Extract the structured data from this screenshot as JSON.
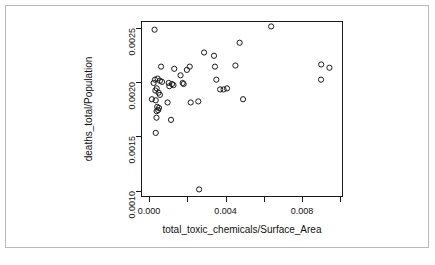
{
  "figure": {
    "background": "#ffffff",
    "frame_color": "#b9b9b9",
    "axis_color": "#1a1a1a",
    "point_color": "#1a1a1a"
  },
  "chart_data": {
    "type": "scatter",
    "title": "",
    "xlabel": "total_toxic_chemicals/Surface_Area",
    "ylabel": "deaths_total/Population",
    "xlim": [
      -0.00042,
      0.01015
    ],
    "ylim": [
      0.00094,
      0.00256
    ],
    "xticks": [
      0.0,
      0.004,
      0.008
    ],
    "xtick_labels": [
      "0.000",
      "0.004",
      "0.008"
    ],
    "xticks_minor": [
      0.002,
      0.006,
      0.01
    ],
    "yticks": [
      0.001,
      0.0015,
      0.002,
      0.0025
    ],
    "ytick_labels": [
      "0.0010",
      "0.0015",
      "0.0020",
      "0.0025"
    ],
    "grid": false,
    "legend": null,
    "marker": "open-circle",
    "n_points": 48,
    "points": [
      [
        0.00029,
        0.00248
      ],
      [
        0.00063,
        0.00214
      ],
      [
        0.00132,
        0.00212
      ],
      [
        0.00045,
        0.00203
      ],
      [
        0.00031,
        0.00202
      ],
      [
        0.00057,
        0.00201
      ],
      [
        0.00068,
        0.002
      ],
      [
        0.00024,
        0.00199
      ],
      [
        0.00103,
        0.00199
      ],
      [
        0.0012,
        0.00198
      ],
      [
        0.00128,
        0.00197
      ],
      [
        0.0004,
        0.00194
      ],
      [
        0.00033,
        0.00192
      ],
      [
        0.0005,
        0.0019
      ],
      [
        0.00057,
        0.00188
      ],
      [
        0.00015,
        0.00184
      ],
      [
        0.00035,
        0.00183
      ],
      [
        0.00097,
        0.00181
      ],
      [
        0.00043,
        0.00177
      ],
      [
        0.00052,
        0.00176
      ],
      [
        0.00048,
        0.00174
      ],
      [
        0.0004,
        0.00173
      ],
      [
        0.00039,
        0.00167
      ],
      [
        0.00115,
        0.00165
      ],
      [
        0.00035,
        0.00153
      ],
      [
        0.00165,
        0.00206
      ],
      [
        0.00198,
        0.00211
      ],
      [
        0.00213,
        0.00214
      ],
      [
        0.00176,
        0.00199
      ],
      [
        0.00181,
        0.00198
      ],
      [
        0.00218,
        0.00181
      ],
      [
        0.00258,
        0.00182
      ],
      [
        0.00262,
        0.00101
      ],
      [
        0.00288,
        0.00227
      ],
      [
        0.0034,
        0.00224
      ],
      [
        0.00345,
        0.00214
      ],
      [
        0.00352,
        0.00202
      ],
      [
        0.00372,
        0.00193
      ],
      [
        0.0039,
        0.00193
      ],
      [
        0.00408,
        0.00194
      ],
      [
        0.00452,
        0.00215
      ],
      [
        0.00474,
        0.00236
      ],
      [
        0.00492,
        0.00184
      ],
      [
        0.00639,
        0.00251
      ],
      [
        0.00901,
        0.00216
      ],
      [
        0.009,
        0.00202
      ],
      [
        0.00944,
        0.00213
      ],
      [
        0.00106,
        0.00196
      ]
    ]
  }
}
